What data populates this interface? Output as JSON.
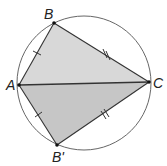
{
  "diagram": {
    "type": "geometry",
    "circle": {
      "cx": 84,
      "cy": 83,
      "r": 67,
      "stroke": "#444444"
    },
    "points": {
      "A": {
        "label": "A",
        "x": 19,
        "y": 85
      },
      "B": {
        "label": "B",
        "x": 54,
        "y": 23
      },
      "C": {
        "label": "C",
        "x": 149,
        "y": 82
      },
      "B_prime": {
        "label": "B'",
        "x": 57,
        "y": 145
      }
    },
    "triangles": [
      {
        "name": "ABC",
        "vertices": [
          "A",
          "B",
          "C"
        ],
        "fill": "#d8d8d8"
      },
      {
        "name": "AB'C",
        "vertices": [
          "A",
          "B_prime",
          "C"
        ],
        "fill": "#c6c6c6"
      }
    ],
    "segments": [
      {
        "from": "A",
        "to": "B",
        "tick_marks": 1
      },
      {
        "from": "B",
        "to": "C",
        "tick_marks": 2
      },
      {
        "from": "A",
        "to": "C",
        "tick_marks": 0
      },
      {
        "from": "A",
        "to": "B_prime",
        "tick_marks": 1
      },
      {
        "from": "B_prime",
        "to": "C",
        "tick_marks": 2
      }
    ],
    "labels": {
      "A": "A",
      "B": "B",
      "C": "C",
      "B_prime": "B'"
    },
    "colors": {
      "line": "#333333",
      "upper_fill": "#d8d8d8",
      "lower_fill": "#c6c6c6",
      "point": "#111111"
    }
  }
}
